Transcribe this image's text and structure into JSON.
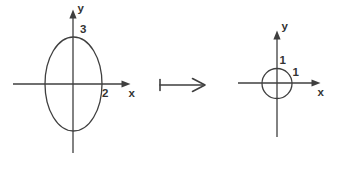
{
  "left_plot": {
    "shape": "ellipse",
    "x_semi_axis": 2,
    "y_semi_axis": 3,
    "labels": {
      "y_axis": "y",
      "x_axis": "x",
      "y_intercept": "3",
      "x_intercept": "2"
    }
  },
  "operator": {
    "symbol": "maps-to"
  },
  "right_plot": {
    "shape": "circle",
    "radius": 1,
    "labels": {
      "y_axis": "y",
      "x_axis": "x",
      "y_intercept": "1",
      "x_intercept": "1"
    }
  },
  "colors": {
    "line": "#3f3f3f",
    "text": "#333333",
    "background": "#ffffff"
  }
}
